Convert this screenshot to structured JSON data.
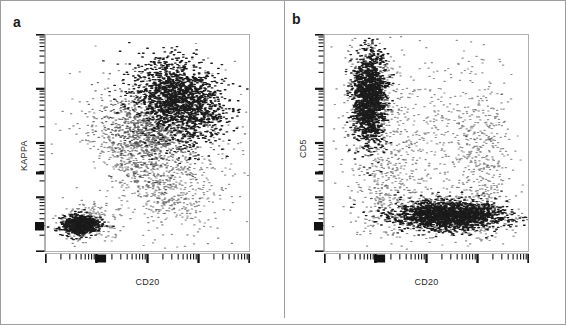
{
  "figure": {
    "kind": "flow-cytometry-dual-scatter",
    "background_color": "#ffffff",
    "border_color": "#9d9d9d",
    "dot_color": "#111111",
    "axis_color": "#b0b0b0",
    "tick_color": "#1a1a1a"
  },
  "panels": [
    {
      "letter": "a",
      "xlabel": "CD20",
      "ylabel": "KAPPA",
      "axis_scale": "log",
      "decades": 4
    },
    {
      "letter": "b",
      "xlabel": "CD20",
      "ylabel": "CD5",
      "axis_scale": "log",
      "decades": 4
    }
  ],
  "chart_data": [
    {
      "type": "scatter",
      "title": "a",
      "xlabel": "CD20",
      "ylabel": "KAPPA",
      "xscale": "log",
      "yscale": "log",
      "xlim": [
        0,
        1
      ],
      "ylim": [
        0,
        1
      ],
      "grid": false,
      "legend": "none",
      "tick_labels_shown": false,
      "populations": [
        {
          "name": "CD20-negative KAPPA-negative cluster",
          "cx": 0.17,
          "cy": 0.12,
          "sx": 0.042,
          "sy": 0.021,
          "rot_deg": 0,
          "n": 900,
          "density": "very-high"
        },
        {
          "name": "CD20-negative KAPPA-negative halo",
          "cx": 0.2,
          "cy": 0.13,
          "sx": 0.075,
          "sy": 0.038,
          "rot_deg": 0,
          "n": 260,
          "density": "low"
        },
        {
          "name": "CD20-bright KAPPA-bright clonal B cells",
          "cx": 0.66,
          "cy": 0.7,
          "sx": 0.11,
          "sy": 0.085,
          "rot_deg": -32,
          "n": 1700,
          "density": "very-high"
        },
        {
          "name": "CD20 dim-to-moderate KAPPA intermediate",
          "cx": 0.5,
          "cy": 0.56,
          "sx": 0.12,
          "sy": 0.075,
          "rot_deg": -25,
          "n": 800,
          "density": "medium"
        },
        {
          "name": "diagonal continuum bridging clusters",
          "cx": 0.44,
          "cy": 0.4,
          "sx": 0.17,
          "sy": 0.055,
          "rot_deg": -40,
          "n": 420,
          "density": "low"
        },
        {
          "name": "scattered low-kappa CD20 positive events",
          "cx": 0.62,
          "cy": 0.28,
          "sx": 0.14,
          "sy": 0.1,
          "rot_deg": 0,
          "n": 330,
          "density": "sparse"
        },
        {
          "name": "background spread",
          "cx": 0.55,
          "cy": 0.52,
          "sx": 0.22,
          "sy": 0.21,
          "rot_deg": 0,
          "n": 260,
          "density": "sparse"
        }
      ]
    },
    {
      "type": "scatter",
      "title": "b",
      "xlabel": "CD20",
      "ylabel": "CD5",
      "xscale": "log",
      "yscale": "log",
      "xlim": [
        0,
        1
      ],
      "ylim": [
        0,
        1
      ],
      "grid": false,
      "legend": "none",
      "tick_labels_shown": false,
      "populations": [
        {
          "name": "CD5-bright CD20-negative T cells",
          "cx": 0.215,
          "cy": 0.705,
          "sx": 0.04,
          "sy": 0.105,
          "rot_deg": 0,
          "n": 1500,
          "density": "very-high"
        },
        {
          "name": "CD5-bright halo",
          "cx": 0.225,
          "cy": 0.69,
          "sx": 0.07,
          "sy": 0.145,
          "rot_deg": 0,
          "n": 420,
          "density": "low"
        },
        {
          "name": "CD20-positive CD5-negative B cells",
          "cx": 0.615,
          "cy": 0.165,
          "sx": 0.135,
          "sy": 0.032,
          "rot_deg": 0,
          "n": 1900,
          "density": "very-high"
        },
        {
          "name": "CD20-positive CD5-negative halo",
          "cx": 0.58,
          "cy": 0.17,
          "sx": 0.185,
          "sy": 0.055,
          "rot_deg": 0,
          "n": 520,
          "density": "low"
        },
        {
          "name": "CD5 dim CD20 dim transition",
          "cx": 0.3,
          "cy": 0.3,
          "sx": 0.075,
          "sy": 0.13,
          "rot_deg": 0,
          "n": 260,
          "density": "sparse"
        },
        {
          "name": "CD20-positive right-edge vertical spread",
          "cx": 0.78,
          "cy": 0.42,
          "sx": 0.065,
          "sy": 0.19,
          "rot_deg": 0,
          "n": 380,
          "density": "sparse"
        },
        {
          "name": "mid-field background events",
          "cx": 0.52,
          "cy": 0.52,
          "sx": 0.2,
          "sy": 0.19,
          "rot_deg": 0,
          "n": 430,
          "density": "sparse"
        }
      ]
    }
  ]
}
